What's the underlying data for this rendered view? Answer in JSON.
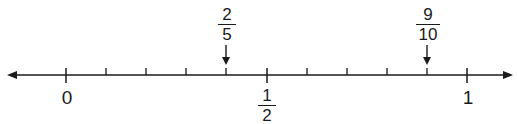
{
  "diagram": {
    "type": "number_line",
    "range": [
      0,
      1
    ],
    "intervals": 10,
    "interval_size": "1/10",
    "arrows_both_ends": true,
    "colors": {
      "line": "#1a1a1a",
      "background": "#ffffff"
    },
    "labels_below": [
      {
        "value": 0,
        "text": "0"
      },
      {
        "value": 0.5,
        "numerator": "1",
        "denominator": "2"
      },
      {
        "value": 1,
        "text": "1"
      }
    ],
    "markers_above": [
      {
        "value": 0.4,
        "numerator": "2",
        "denominator": "5",
        "arrow": "down"
      },
      {
        "value": 0.9,
        "numerator": "9",
        "denominator": "10",
        "arrow": "down"
      }
    ]
  }
}
